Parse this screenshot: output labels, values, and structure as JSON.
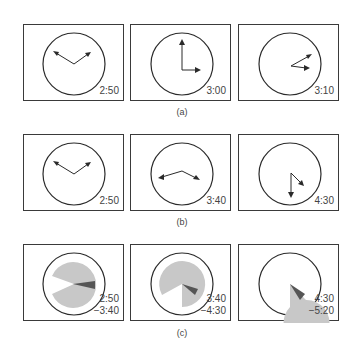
{
  "figure": {
    "rows": [
      {
        "caption": "(a)",
        "panels": [
          {
            "time": "2:50",
            "hour_angle": 85,
            "minute_angle": 300
          },
          {
            "time": "3:00",
            "hour_angle": 90,
            "minute_angle": 0
          },
          {
            "time": "3:10",
            "hour_angle": 95,
            "minute_angle": 60
          }
        ]
      },
      {
        "caption": "(b)",
        "panels": [
          {
            "time": "2:50",
            "hour_angle": 55,
            "minute_angle": 300
          },
          {
            "time": "3:40",
            "hour_angle": 110,
            "minute_angle": 255
          },
          {
            "time": "4:30",
            "hour_angle": 135,
            "minute_angle": 180
          }
        ]
      },
      {
        "caption": "(c)",
        "panels": [
          {
            "time": "2:50",
            "time2": "−3:40",
            "gap_start": 245,
            "gap_end": 300,
            "dark_start": 85,
            "dark_end": 100
          },
          {
            "time": "3:40",
            "time2": "−4:30",
            "gap_start": 180,
            "gap_end": 245,
            "dark_start": 110,
            "dark_end": 125
          },
          {
            "time": "4:30",
            "time2": "−5:20",
            "gap_start": 135,
            "gap_end": 180,
            "dark_start": 135,
            "dark_end": 150
          }
        ]
      }
    ],
    "colors": {
      "stroke": "#2a2a2a",
      "sector_fill": "#c8c8c8",
      "hand_sector_fill": "#555555"
    }
  }
}
